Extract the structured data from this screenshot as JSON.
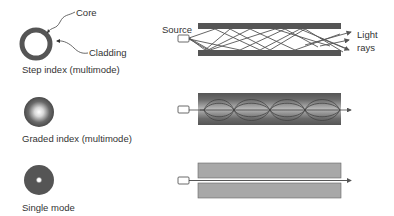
{
  "colors": {
    "cladding_dark": "#555555",
    "cladding_light": "#a8a8a8",
    "core_mid": "#909090",
    "ray": "#555555",
    "background": "#ffffff"
  },
  "fibers": [
    {
      "id": "step-index",
      "label": "Step index (multimode)",
      "cross_section_annotations": [
        "Core",
        "Cladding"
      ],
      "side_annotations": [
        "Source",
        "Light",
        "rays"
      ]
    },
    {
      "id": "graded-index",
      "label": "Graded index (multimode)"
    },
    {
      "id": "single-mode",
      "label": "Single mode"
    }
  ],
  "annotations": {
    "core": "Core",
    "cladding": "Cladding",
    "source": "Source",
    "light_line1": "Light",
    "light_line2": "rays"
  }
}
